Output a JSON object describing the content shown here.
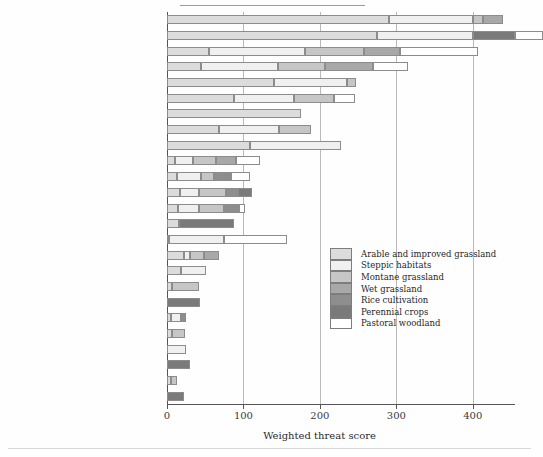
{
  "chart_data": {
    "type": "bar",
    "orientation": "horizontal",
    "stacked": true,
    "title": "",
    "xlabel": "Weighted threat score",
    "ylabel": "",
    "xlim": [
      0,
      450
    ],
    "xticks": [
      0,
      100,
      200,
      300,
      400
    ],
    "xticklabels": [
      "0",
      "100",
      "200",
      "300",
      "400"
    ],
    "grid": "vertical",
    "legend_position": "inside-right",
    "categories": [
      "1. Crop improvements",
      "2. Pesticide use",
      "3. Land abandonment",
      "4. High stocking levels",
      "5. Loss of marginal habitats",
      "6. Afforestation",
      "7. Cultivation of grassland",
      "8. Farming operations",
      "9. Loss of crop diversity",
      "10. Recreation",
      "11. Overhead structures",
      "12. Increased predators",
      "13. Urbanization",
      "14. Drainage and flood control",
      "15. Reduction in oak density",
      "16. Loss of hay meadows",
      "17. Low stocking levels",
      "18. Atmospheric nutrient deposition",
      "19. Replacement of old crop-trees",
      "20. Loss of old buildings",
      "21. Reduction in livestock carcasses",
      "22. Autumn sowing of crops",
      "23. Clearance of ground vegetation",
      "24. Conversion of pasture",
      "25. Dry cultivation of rice"
    ],
    "series": [
      {
        "name": "Arable and improved grassland",
        "color": "#dcdcdc",
        "values": [
          290,
          275,
          55,
          45,
          140,
          88,
          175,
          68,
          108,
          10,
          13,
          17,
          14,
          16,
          2,
          22,
          18,
          6,
          0,
          5,
          6,
          0,
          0,
          5,
          0
        ]
      },
      {
        "name": "Steppic habitats",
        "color": "#f0f0f0",
        "values": [
          110,
          125,
          125,
          100,
          95,
          78,
          0,
          78,
          120,
          24,
          32,
          25,
          28,
          0,
          72,
          8,
          33,
          0,
          0,
          13,
          0,
          25,
          0,
          0,
          0
        ]
      },
      {
        "name": "Montane grassland",
        "color": "#c6c6c6",
        "values": [
          13,
          0,
          78,
          62,
          12,
          52,
          0,
          42,
          0,
          30,
          17,
          35,
          32,
          0,
          0,
          18,
          0,
          36,
          0,
          0,
          18,
          0,
          0,
          8,
          0
        ]
      },
      {
        "name": "Wet grassland",
        "color": "#a8a8a8",
        "values": [
          26,
          0,
          47,
          62,
          0,
          0,
          0,
          0,
          0,
          26,
          0,
          0,
          0,
          0,
          0,
          20,
          0,
          0,
          0,
          0,
          0,
          0,
          0,
          0,
          0
        ]
      },
      {
        "name": "Rice cultivation",
        "color": "#8e8e8e",
        "values": [
          0,
          0,
          0,
          0,
          0,
          0,
          0,
          0,
          0,
          0,
          22,
          16,
          20,
          0,
          0,
          0,
          0,
          0,
          0,
          7,
          0,
          0,
          0,
          0,
          0
        ]
      },
      {
        "name": "Perennial crops",
        "color": "#7a7a7a",
        "values": [
          0,
          55,
          0,
          0,
          0,
          0,
          0,
          0,
          0,
          0,
          0,
          18,
          0,
          72,
          0,
          0,
          0,
          0,
          43,
          0,
          0,
          0,
          30,
          0,
          22
        ]
      },
      {
        "name": "Pastoral woodland",
        "color": "#ffffff",
        "values": [
          0,
          37,
          102,
          46,
          0,
          28,
          0,
          0,
          0,
          32,
          24,
          0,
          8,
          0,
          82,
          0,
          0,
          0,
          0,
          0,
          0,
          0,
          0,
          0,
          0
        ]
      }
    ],
    "totals": [
      439,
      492,
      407,
      315,
      247,
      246,
      175,
      188,
      228,
      122,
      108,
      111,
      102,
      88,
      156,
      68,
      51,
      42,
      43,
      25,
      24,
      25,
      30,
      13,
      22
    ]
  },
  "legend": {
    "items": [
      {
        "label": "Arable and improved grassland",
        "color": "#dcdcdc"
      },
      {
        "label": "Steppic habitats",
        "color": "#f0f0f0"
      },
      {
        "label": "Montane grassland",
        "color": "#c6c6c6"
      },
      {
        "label": "Wet grassland",
        "color": "#a8a8a8"
      },
      {
        "label": "Rice cultivation",
        "color": "#8e8e8e"
      },
      {
        "label": "Perennial crops",
        "color": "#7a7a7a"
      },
      {
        "label": "Pastoral woodland",
        "color": "#ffffff"
      }
    ]
  }
}
